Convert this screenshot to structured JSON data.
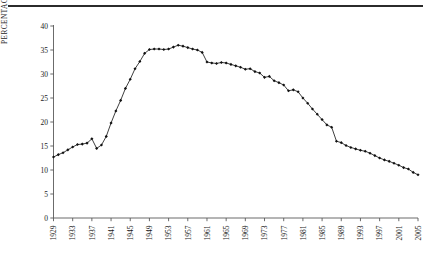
{
  "figure": {
    "top_rule": true,
    "background_color": "#ffffff",
    "ink_color": "#1c1c1c"
  },
  "chart_data": {
    "type": "line",
    "title": "",
    "subtitle": "",
    "xlabel": "",
    "ylabel": "PERCENTAGE OF PRIVATE SECTOR EMPLOYEES",
    "xlim": [
      1929,
      2005
    ],
    "ylim": [
      0,
      40
    ],
    "grid": false,
    "legend": null,
    "marker": "filled-diamond",
    "line_color": "#1c1c1c",
    "marker_color": "#111111",
    "ytick_values": [
      0,
      5,
      10,
      15,
      20,
      25,
      30,
      35,
      40
    ],
    "ytick_labels": [
      "0",
      "5",
      "10",
      "15",
      "20",
      "25",
      "30",
      "35",
      "40"
    ],
    "xtick_values": [
      1929,
      1933,
      1937,
      1941,
      1945,
      1949,
      1953,
      1957,
      1961,
      1965,
      1969,
      1973,
      1977,
      1981,
      1985,
      1989,
      1993,
      1997,
      2001,
      2005
    ],
    "xtick_labels": [
      "1929",
      "1933",
      "1937",
      "1941",
      "1945",
      "1949",
      "1953",
      "1957",
      "1961",
      "1965",
      "1969",
      "1973",
      "1977",
      "1981",
      "1985",
      "1989",
      "1993",
      "1997",
      "2001",
      "2005"
    ],
    "xtick_rotation": -90,
    "x": [
      1929,
      1930,
      1931,
      1932,
      1933,
      1934,
      1935,
      1936,
      1937,
      1938,
      1939,
      1940,
      1941,
      1942,
      1943,
      1944,
      1945,
      1946,
      1947,
      1948,
      1949,
      1950,
      1951,
      1952,
      1953,
      1954,
      1955,
      1956,
      1957,
      1958,
      1959,
      1960,
      1961,
      1962,
      1963,
      1964,
      1965,
      1966,
      1967,
      1968,
      1969,
      1970,
      1971,
      1972,
      1973,
      1974,
      1975,
      1976,
      1977,
      1978,
      1979,
      1980,
      1981,
      1982,
      1983,
      1984,
      1985,
      1986,
      1987,
      1988,
      1989,
      1990,
      1991,
      1992,
      1993,
      1994,
      1995,
      1996,
      1997,
      1998,
      1999,
      2000,
      2001,
      2002,
      2003,
      2004,
      2005
    ],
    "y": [
      12.7,
      13.2,
      13.6,
      14.2,
      14.8,
      15.3,
      15.4,
      15.6,
      16.5,
      14.5,
      15.2,
      17.0,
      19.8,
      22.3,
      24.5,
      27.0,
      28.9,
      31.1,
      32.6,
      34.3,
      35.1,
      35.2,
      35.2,
      35.1,
      35.2,
      35.6,
      36.0,
      35.8,
      35.5,
      35.2,
      35.0,
      34.5,
      32.5,
      32.3,
      32.2,
      32.4,
      32.3,
      32.0,
      31.7,
      31.4,
      31.0,
      31.1,
      30.5,
      30.2,
      29.3,
      29.5,
      28.6,
      28.2,
      27.7,
      26.5,
      26.7,
      26.3,
      25.0,
      23.9,
      22.7,
      21.6,
      20.5,
      19.4,
      18.9,
      16.0,
      15.7,
      15.1,
      14.7,
      14.4,
      14.1,
      13.9,
      13.5,
      13.0,
      12.5,
      12.1,
      11.8,
      11.4,
      11.0,
      10.5,
      10.2,
      9.5,
      9.0,
      8.6,
      8.3
    ]
  }
}
